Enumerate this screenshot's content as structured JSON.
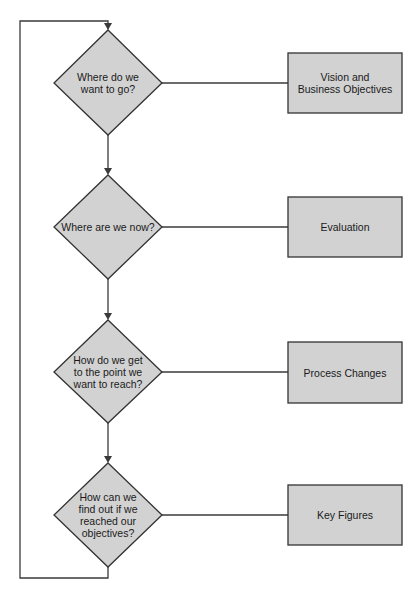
{
  "colors": {
    "shape_fill": "#d2d2d2",
    "shape_stroke": "#333333",
    "line": "#3a3a3a",
    "background": "#ffffff"
  },
  "decisions": [
    {
      "id": "d1",
      "label": "Where do we\nwant to go?"
    },
    {
      "id": "d2",
      "label": "Where are we now?"
    },
    {
      "id": "d3",
      "label": "How do we get\nto the point we\nwant to reach?"
    },
    {
      "id": "d4",
      "label": "How can we\nfind out if we\nreached our\nobjectives?"
    }
  ],
  "outcomes": [
    {
      "id": "o1",
      "label": "Vision and\nBusiness Objectives"
    },
    {
      "id": "o2",
      "label": "Evaluation"
    },
    {
      "id": "o3",
      "label": "Process Changes"
    },
    {
      "id": "o4",
      "label": "Key Figures"
    }
  ]
}
